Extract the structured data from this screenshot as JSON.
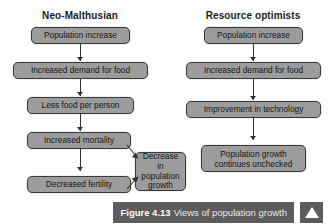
{
  "figure": {
    "caption_label": "Figure 4.13",
    "caption_text": "Views of population growth",
    "nav_icon": "triangle-up-icon"
  },
  "colors": {
    "node_fill": "#9c9c9c",
    "node_border": "#3a3a3a",
    "arrow": "#2f2f2f",
    "caption_bar": "#5c5c5c",
    "caption_text": "#e9e9e9",
    "page_background": "#ffffff"
  },
  "diagram": {
    "type": "flowchart",
    "columns": [
      {
        "id": "neo-malthusian",
        "heading": "Neo-Malthusian",
        "nodes": [
          {
            "id": "nm-1",
            "label": "Population increase"
          },
          {
            "id": "nm-2",
            "label": "Increased demand for food"
          },
          {
            "id": "nm-3",
            "label": "Less food per person"
          },
          {
            "id": "nm-4",
            "label": "Increased mortality"
          },
          {
            "id": "nm-5",
            "label": "Decreased fertility"
          },
          {
            "id": "nm-6",
            "label": "Decrease in\npopulation\ngrowth"
          }
        ],
        "edges": [
          {
            "from": "nm-1",
            "to": "nm-2",
            "style": "vertical-arrow"
          },
          {
            "from": "nm-2",
            "to": "nm-3",
            "style": "vertical-arrow"
          },
          {
            "from": "nm-3",
            "to": "nm-4",
            "style": "vertical-arrow"
          },
          {
            "from": "nm-4",
            "to": "nm-5",
            "style": "vertical-arrow"
          },
          {
            "from": "nm-4",
            "to": "nm-6",
            "style": "diagonal-arrow"
          },
          {
            "from": "nm-5",
            "to": "nm-6",
            "style": "diagonal-arrow"
          }
        ]
      },
      {
        "id": "resource-optimists",
        "heading": "Resource optimists",
        "nodes": [
          {
            "id": "ro-1",
            "label": "Population increase"
          },
          {
            "id": "ro-2",
            "label": "Increased demand for food"
          },
          {
            "id": "ro-3",
            "label": "Improvement in technology"
          },
          {
            "id": "ro-4",
            "label": "Population growth\ncontinues unchecked"
          }
        ],
        "edges": [
          {
            "from": "ro-1",
            "to": "ro-2",
            "style": "vertical-arrow"
          },
          {
            "from": "ro-2",
            "to": "ro-3",
            "style": "vertical-arrow"
          },
          {
            "from": "ro-3",
            "to": "ro-4",
            "style": "vertical-arrow"
          }
        ]
      }
    ]
  }
}
